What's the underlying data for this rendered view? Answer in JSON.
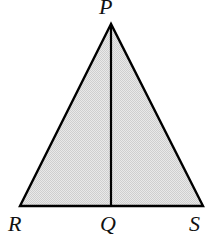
{
  "figure": {
    "kind": "geometry-diagram",
    "canvas": {
      "width": 214,
      "height": 244,
      "background": "#ffffff"
    },
    "style": {
      "fill_color": "#dcdcdc",
      "stroke_color": "#000000",
      "stroke_width": 2,
      "label_color": "#111111"
    },
    "points": {
      "P": {
        "label": "P",
        "x": 111,
        "y": 24
      },
      "R": {
        "label": "R",
        "x": 20,
        "y": 206
      },
      "Q": {
        "label": "Q",
        "x": 111,
        "y": 206
      },
      "S": {
        "label": "S",
        "x": 203,
        "y": 206
      }
    },
    "segments": [
      {
        "name": "PR",
        "from": "P",
        "to": "R"
      },
      {
        "name": "RS",
        "from": "R",
        "to": "S"
      },
      {
        "name": "SP",
        "from": "S",
        "to": "P"
      },
      {
        "name": "PQ",
        "from": "P",
        "to": "Q"
      }
    ],
    "shaded_region": {
      "name": "triangle-PRS",
      "vertices": [
        "P",
        "R",
        "S"
      ]
    }
  }
}
